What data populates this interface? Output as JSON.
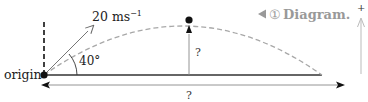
{
  "diagram": {
    "origin_label": "origin",
    "velocity_label_main": "20 ms",
    "velocity_label_exp": "−1",
    "angle_label": "40°",
    "height_label": "?",
    "range_label": "?",
    "tag_label": "Diagram.",
    "tag_number": "①",
    "axis_plus_label": "+",
    "launch_speed_ms": 20,
    "launch_angle_deg": 40,
    "colors": {
      "ink": "#111111",
      "line": "#444444",
      "dashed_path": "#a8a8a8",
      "tag": "#999999",
      "light_arrow": "#bbbbbb"
    }
  }
}
